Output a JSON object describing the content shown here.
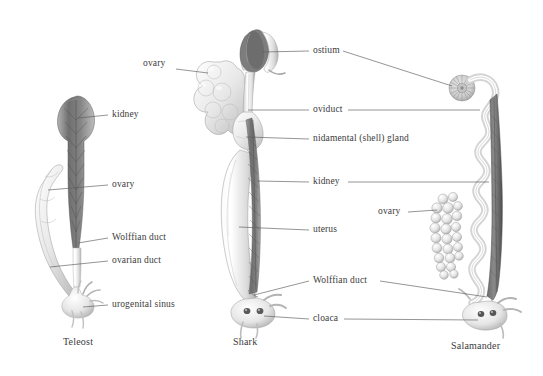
{
  "figure": {
    "background": "#ffffff",
    "line_color": "#555555",
    "text_color": "#3b3b3b"
  },
  "captions": [
    {
      "id": "teleost",
      "text": "Teleost",
      "x": 63,
      "y": 341
    },
    {
      "id": "shark",
      "text": "Shark",
      "x": 233,
      "y": 341
    },
    {
      "id": "salamander",
      "text": "Salamander",
      "x": 451,
      "y": 345
    }
  ],
  "labels": [
    {
      "id": "ovary-shark",
      "text": "ovary",
      "x": 143,
      "y": 64
    },
    {
      "id": "kidney-teleost",
      "text": "kidney",
      "x": 112,
      "y": 110
    },
    {
      "id": "ovary-teleost",
      "text": "ovary",
      "x": 112,
      "y": 180
    },
    {
      "id": "wolffian-teleost",
      "text": "Wolffian duct",
      "x": 112,
      "y": 233
    },
    {
      "id": "ovarian-duct",
      "text": "ovarian duct",
      "x": 112,
      "y": 256
    },
    {
      "id": "urogenital-sinus",
      "text": "urogenital sinus",
      "x": 112,
      "y": 300
    },
    {
      "id": "ostium",
      "text": "ostium",
      "x": 313,
      "y": 46
    },
    {
      "id": "oviduct",
      "text": "oviduct",
      "x": 313,
      "y": 105
    },
    {
      "id": "nidamental",
      "text": "nidamental (shell) gland",
      "x": 313,
      "y": 134
    },
    {
      "id": "kidney-shark",
      "text": "kidney",
      "x": 313,
      "y": 177
    },
    {
      "id": "uterus",
      "text": "uterus",
      "x": 313,
      "y": 225
    },
    {
      "id": "ovary-salamander",
      "text": "ovary",
      "x": 378,
      "y": 207
    },
    {
      "id": "wolffian-shared",
      "text": "Wolffian duct",
      "x": 313,
      "y": 277
    },
    {
      "id": "cloaca",
      "text": "cloaca",
      "x": 313,
      "y": 315
    }
  ],
  "specimens": [
    {
      "id": "teleost",
      "common_name": "Teleost",
      "structures": [
        "kidney",
        "ovary",
        "Wolffian duct",
        "ovarian duct",
        "urogenital sinus"
      ]
    },
    {
      "id": "shark",
      "common_name": "Shark",
      "structures": [
        "ovary",
        "ostium",
        "oviduct",
        "nidamental (shell) gland",
        "kidney",
        "uterus",
        "Wolffian duct",
        "cloaca"
      ]
    },
    {
      "id": "salamander",
      "common_name": "Salamander",
      "structures": [
        "ostium",
        "oviduct",
        "ovary",
        "kidney",
        "Wolffian duct",
        "cloaca"
      ]
    }
  ]
}
